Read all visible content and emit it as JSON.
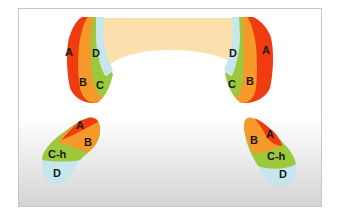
{
  "diagram": {
    "type": "dental occlusion zone diagram",
    "colors": {
      "A": "#f03a10",
      "B": "#f7982a",
      "C": "#9cc83c",
      "D": "#c6e6ee",
      "arch": "#fbe0ae",
      "background_bottom": "#d4d4d4",
      "frame_border": "#c8c8c8"
    },
    "upper_left": {
      "labels": [
        "A",
        "B",
        "C",
        "D"
      ]
    },
    "upper_right": {
      "labels": [
        "D",
        "A",
        "C",
        "B"
      ]
    },
    "lower_left": {
      "labels": [
        "A",
        "B",
        "C-h",
        "D"
      ]
    },
    "lower_right": {
      "labels": [
        "B",
        "A",
        "C-h",
        "D"
      ]
    }
  }
}
